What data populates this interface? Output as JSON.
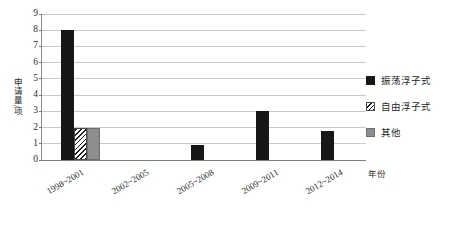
{
  "chart_data": {
    "type": "bar",
    "title": "",
    "xlabel": "年份",
    "ylabel": "申请量/项",
    "categories": [
      "1998~2001",
      "2002~2005",
      "2005~2008",
      "2009~2011",
      "2012~2014"
    ],
    "series": [
      {
        "name": "振荡浮子式",
        "color": "#171717",
        "pattern": "solid",
        "values": [
          8,
          0,
          0.9,
          3,
          1.8
        ]
      },
      {
        "name": "自由浮子式",
        "color": "#1d1d1d",
        "pattern": "diagonal-hatch",
        "values": [
          2,
          0,
          0,
          0,
          0
        ]
      },
      {
        "name": "其他",
        "color": "#8e8e8e",
        "pattern": "solid",
        "values": [
          2,
          0,
          0,
          0,
          0
        ]
      }
    ],
    "ylim": [
      0,
      9
    ],
    "yticks": [
      0,
      1,
      2,
      3,
      4,
      5,
      6,
      7,
      8,
      9
    ],
    "grid": true,
    "legend_position": "right"
  }
}
